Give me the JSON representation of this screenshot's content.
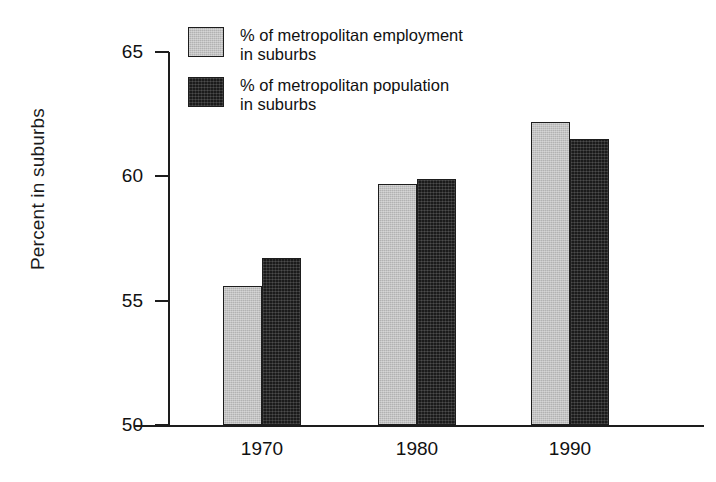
{
  "chart_data": {
    "type": "bar",
    "title": "",
    "subtitle": "",
    "xlabel": "",
    "ylabel": "Percent in suburbs",
    "categories": [
      "1970",
      "1980",
      "1990"
    ],
    "series": [
      {
        "name": "% of metropolitan employment in suburbs",
        "color": "#b2b2b2",
        "values": [
          55.6,
          59.7,
          62.2
        ]
      },
      {
        "name": "% of metropolitan population in suburbs",
        "color": "#1b1b1b",
        "values": [
          56.7,
          59.9,
          61.5
        ]
      }
    ],
    "ylim": [
      50,
      65
    ],
    "yticks": [
      50,
      55,
      60,
      65
    ],
    "ytick_labels": [
      "50",
      "55",
      "60",
      "65"
    ],
    "grid": false,
    "legend_position": "top-left-inside"
  },
  "axis": {
    "y_title": "Percent in suburbs",
    "y_ticks": [
      {
        "value": 65,
        "label": "65"
      },
      {
        "value": 60,
        "label": "60"
      },
      {
        "value": 55,
        "label": "55"
      },
      {
        "value": 50,
        "label": "50"
      }
    ],
    "x_ticks": [
      {
        "label": "1970"
      },
      {
        "label": "1980"
      },
      {
        "label": "1990"
      }
    ]
  },
  "legend": {
    "items": [
      {
        "swatch": "light-gray-swatch",
        "label": "% of metropolitan employment\nin suburbs"
      },
      {
        "swatch": "dark-swatch",
        "label": "% of metropolitan population\nin suburbs"
      }
    ]
  },
  "bars": [
    {
      "name": "bar-1970-employment",
      "value": 55.6
    },
    {
      "name": "bar-1970-population",
      "value": 56.7
    },
    {
      "name": "bar-1980-employment",
      "value": 59.7
    },
    {
      "name": "bar-1980-population",
      "value": 59.9
    },
    {
      "name": "bar-1990-employment",
      "value": 62.2
    },
    {
      "name": "bar-1990-population",
      "value": 61.5
    }
  ],
  "colors": {
    "series_light": "#b2b2b2",
    "series_dark": "#1b1b1b",
    "axis": "#1d1d1d",
    "text": "#111111",
    "background": "#ffffff"
  }
}
